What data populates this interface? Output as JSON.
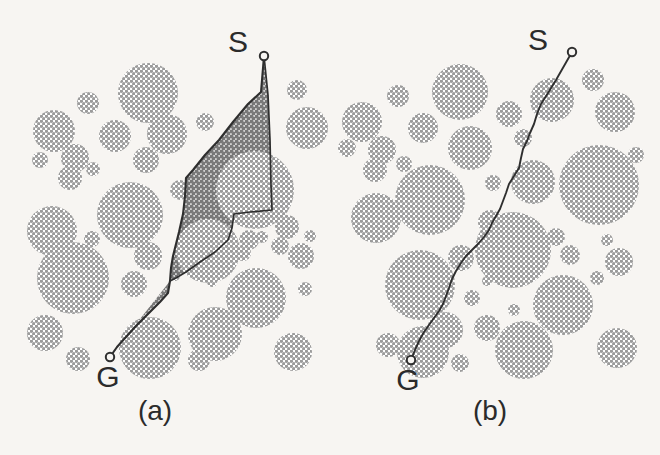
{
  "figure": {
    "background_color": "#f7f5f2",
    "obstacle_fill": "#a9a9a9",
    "swept_region_fill": "#8c8c8c",
    "path_stroke": "#2f2f2f",
    "label_color": "#2b2b2b"
  },
  "panels": [
    {
      "id": "panel-a",
      "caption": "(a)",
      "caption_pos": [
        155,
        420
      ],
      "start_label": "S",
      "goal_label": "G",
      "start_label_pos": [
        238,
        52
      ],
      "goal_label_pos": [
        108,
        387
      ],
      "start_point": [
        264,
        56
      ],
      "goal_point": [
        110,
        357
      ],
      "has_swept_region": true,
      "path_points": [
        [
          264,
          56
        ],
        [
          261,
          92
        ],
        [
          248,
          104
        ],
        [
          233,
          122
        ],
        [
          219,
          140
        ],
        [
          205,
          155
        ],
        [
          193,
          170
        ],
        [
          186,
          178
        ],
        [
          185,
          196
        ],
        [
          183,
          214
        ],
        [
          179,
          232
        ],
        [
          176,
          244
        ],
        [
          173,
          256
        ],
        [
          171,
          268
        ],
        [
          170,
          281
        ],
        [
          168,
          293
        ],
        [
          160,
          302
        ],
        [
          148,
          314
        ],
        [
          136,
          326
        ],
        [
          126,
          337
        ],
        [
          117,
          347
        ],
        [
          110,
          357
        ]
      ],
      "sweep_right_boundary": [
        [
          264,
          56
        ],
        [
          268,
          95
        ],
        [
          270,
          140
        ],
        [
          271,
          185
        ],
        [
          272,
          210
        ],
        [
          250,
          212
        ],
        [
          234,
          214
        ],
        [
          232,
          228
        ],
        [
          228,
          240
        ],
        [
          215,
          252
        ],
        [
          200,
          262
        ],
        [
          186,
          272
        ],
        [
          176,
          278
        ],
        [
          170,
          281
        ]
      ]
    },
    {
      "id": "panel-b",
      "caption": "(b)",
      "caption_pos": [
        490,
        420
      ],
      "start_label": "S",
      "goal_label": "G",
      "start_label_pos": [
        538,
        50
      ],
      "goal_label_pos": [
        408,
        390
      ],
      "start_point": [
        572,
        52
      ],
      "goal_point": [
        411,
        360
      ],
      "has_swept_region": false,
      "path_points": [
        [
          572,
          52
        ],
        [
          564,
          66
        ],
        [
          556,
          80
        ],
        [
          548,
          93
        ],
        [
          541,
          104
        ],
        [
          537,
          114
        ],
        [
          534,
          124
        ],
        [
          530,
          133
        ],
        [
          527,
          141
        ],
        [
          523,
          149
        ],
        [
          521,
          158
        ],
        [
          519,
          168
        ],
        [
          514,
          176
        ],
        [
          509,
          184
        ],
        [
          506,
          193
        ],
        [
          503,
          201
        ],
        [
          500,
          209
        ],
        [
          496,
          216
        ],
        [
          492,
          223
        ],
        [
          489,
          230
        ],
        [
          484,
          237
        ],
        [
          478,
          244
        ],
        [
          472,
          250
        ],
        [
          466,
          256
        ],
        [
          461,
          263
        ],
        [
          456,
          271
        ],
        [
          452,
          279
        ],
        [
          449,
          288
        ],
        [
          446,
          296
        ],
        [
          443,
          304
        ],
        [
          439,
          311
        ],
        [
          434,
          318
        ],
        [
          429,
          325
        ],
        [
          424,
          332
        ],
        [
          419,
          341
        ],
        [
          415,
          350
        ],
        [
          411,
          360
        ]
      ]
    }
  ],
  "obstacles_panel_a": [
    {
      "cx": 148,
      "cy": 93,
      "r": 30
    },
    {
      "cx": 88,
      "cy": 103,
      "r": 11
    },
    {
      "cx": 54,
      "cy": 131,
      "r": 21
    },
    {
      "cx": 115,
      "cy": 136,
      "r": 16
    },
    {
      "cx": 40,
      "cy": 160,
      "r": 8
    },
    {
      "cx": 75,
      "cy": 158,
      "r": 14
    },
    {
      "cx": 93,
      "cy": 169,
      "r": 7
    },
    {
      "cx": 70,
      "cy": 178,
      "r": 12
    },
    {
      "cx": 146,
      "cy": 160,
      "r": 13
    },
    {
      "cx": 167,
      "cy": 134,
      "r": 20
    },
    {
      "cx": 205,
      "cy": 122,
      "r": 9
    },
    {
      "cx": 297,
      "cy": 90,
      "r": 10
    },
    {
      "cx": 307,
      "cy": 128,
      "r": 21
    },
    {
      "cx": 130,
      "cy": 215,
      "r": 33
    },
    {
      "cx": 180,
      "cy": 190,
      "r": 10
    },
    {
      "cx": 52,
      "cy": 231,
      "r": 25
    },
    {
      "cx": 92,
      "cy": 239,
      "r": 8
    },
    {
      "cx": 148,
      "cy": 256,
      "r": 14
    },
    {
      "cx": 255,
      "cy": 190,
      "r": 39
    },
    {
      "cx": 208,
      "cy": 251,
      "r": 32
    },
    {
      "cx": 249,
      "cy": 240,
      "r": 10
    },
    {
      "cx": 243,
      "cy": 253,
      "r": 8
    },
    {
      "cx": 262,
      "cy": 237,
      "r": 6
    },
    {
      "cx": 287,
      "cy": 227,
      "r": 12
    },
    {
      "cx": 280,
      "cy": 246,
      "r": 9
    },
    {
      "cx": 310,
      "cy": 236,
      "r": 6
    },
    {
      "cx": 301,
      "cy": 256,
      "r": 13
    },
    {
      "cx": 73,
      "cy": 278,
      "r": 36
    },
    {
      "cx": 134,
      "cy": 284,
      "r": 13
    },
    {
      "cx": 175,
      "cy": 276,
      "r": 5
    },
    {
      "cx": 212,
      "cy": 282,
      "r": 5
    },
    {
      "cx": 256,
      "cy": 298,
      "r": 30
    },
    {
      "cx": 305,
      "cy": 289,
      "r": 7
    },
    {
      "cx": 45,
      "cy": 333,
      "r": 18
    },
    {
      "cx": 78,
      "cy": 359,
      "r": 12
    },
    {
      "cx": 150,
      "cy": 348,
      "r": 31
    },
    {
      "cx": 199,
      "cy": 360,
      "r": 11
    },
    {
      "cx": 215,
      "cy": 334,
      "r": 27
    },
    {
      "cx": 293,
      "cy": 352,
      "r": 19
    },
    {
      "cx": 264,
      "cy": 320,
      "r": 6
    }
  ],
  "obstacles_panel_b": [
    {
      "cx": 460,
      "cy": 92,
      "r": 28
    },
    {
      "cx": 398,
      "cy": 96,
      "r": 11
    },
    {
      "cx": 362,
      "cy": 122,
      "r": 20
    },
    {
      "cx": 423,
      "cy": 128,
      "r": 15
    },
    {
      "cx": 347,
      "cy": 148,
      "r": 9
    },
    {
      "cx": 382,
      "cy": 150,
      "r": 14
    },
    {
      "cx": 404,
      "cy": 164,
      "r": 8
    },
    {
      "cx": 375,
      "cy": 170,
      "r": 12
    },
    {
      "cx": 470,
      "cy": 148,
      "r": 22
    },
    {
      "cx": 509,
      "cy": 114,
      "r": 13
    },
    {
      "cx": 523,
      "cy": 138,
      "r": 9
    },
    {
      "cx": 552,
      "cy": 100,
      "r": 22
    },
    {
      "cx": 593,
      "cy": 80,
      "r": 11
    },
    {
      "cx": 615,
      "cy": 112,
      "r": 20
    },
    {
      "cx": 533,
      "cy": 182,
      "r": 22
    },
    {
      "cx": 493,
      "cy": 183,
      "r": 8
    },
    {
      "cx": 430,
      "cy": 200,
      "r": 35
    },
    {
      "cx": 376,
      "cy": 218,
      "r": 25
    },
    {
      "cx": 490,
      "cy": 222,
      "r": 12
    },
    {
      "cx": 599,
      "cy": 185,
      "r": 40
    },
    {
      "cx": 636,
      "cy": 155,
      "r": 8
    },
    {
      "cx": 607,
      "cy": 240,
      "r": 6
    },
    {
      "cx": 513,
      "cy": 250,
      "r": 38
    },
    {
      "cx": 461,
      "cy": 258,
      "r": 13
    },
    {
      "cx": 556,
      "cy": 237,
      "r": 9
    },
    {
      "cx": 570,
      "cy": 255,
      "r": 10
    },
    {
      "cx": 619,
      "cy": 262,
      "r": 14
    },
    {
      "cx": 597,
      "cy": 278,
      "r": 7
    },
    {
      "cx": 420,
      "cy": 285,
      "r": 35
    },
    {
      "cx": 472,
      "cy": 298,
      "r": 8
    },
    {
      "cx": 487,
      "cy": 281,
      "r": 5
    },
    {
      "cx": 514,
      "cy": 310,
      "r": 6
    },
    {
      "cx": 563,
      "cy": 305,
      "r": 30
    },
    {
      "cx": 487,
      "cy": 328,
      "r": 13
    },
    {
      "cx": 445,
      "cy": 330,
      "r": 18
    },
    {
      "cx": 388,
      "cy": 345,
      "r": 12
    },
    {
      "cx": 423,
      "cy": 352,
      "r": 26
    },
    {
      "cx": 460,
      "cy": 363,
      "r": 9
    },
    {
      "cx": 524,
      "cy": 350,
      "r": 29
    },
    {
      "cx": 617,
      "cy": 348,
      "r": 20
    }
  ]
}
